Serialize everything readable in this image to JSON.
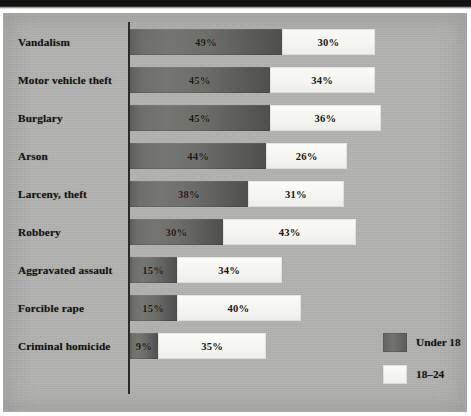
{
  "chart_data": {
    "type": "bar",
    "orientation": "horizontal",
    "stacked": true,
    "title": "",
    "subtitle": "",
    "xlabel": "",
    "ylabel": "",
    "grid": false,
    "xlim": [
      0,
      100
    ],
    "unit": "%",
    "px_per_unit": 3.1,
    "legend_position": "bottom-right",
    "categories": [
      "Vandalism",
      "Motor vehicle theft",
      "Burglary",
      "Arson",
      "Larceny, theft",
      "Robbery",
      "Aggravated assault",
      "Forcible rape",
      "Criminal homicide"
    ],
    "series": [
      {
        "name": "Under 18",
        "color": "#6b6b68",
        "values": [
          49,
          45,
          45,
          44,
          38,
          30,
          15,
          15,
          9
        ],
        "labels": [
          "49%",
          "45%",
          "45%",
          "44%",
          "38%",
          "30%",
          "15%",
          "15%",
          "9%"
        ]
      },
      {
        "name": "18–24",
        "color": "#f7f7f4",
        "values": [
          30,
          34,
          36,
          26,
          31,
          43,
          34,
          40,
          35
        ],
        "labels": [
          "30%",
          "34%",
          "36%",
          "26%",
          "31%",
          "43%",
          "34%",
          "40%",
          "35%"
        ]
      }
    ]
  },
  "rows": [
    {
      "label": "Vandalism",
      "under18": "49%",
      "to24": "30%",
      "under18_val": 49,
      "to24_val": 30
    },
    {
      "label": "Motor vehicle theft",
      "under18": "45%",
      "to24": "34%",
      "under18_val": 45,
      "to24_val": 34
    },
    {
      "label": "Burglary",
      "under18": "45%",
      "to24": "36%",
      "under18_val": 45,
      "to24_val": 36
    },
    {
      "label": "Arson",
      "under18": "44%",
      "to24": "26%",
      "under18_val": 44,
      "to24_val": 26
    },
    {
      "label": "Larceny, theft",
      "under18": "38%",
      "to24": "31%",
      "under18_val": 38,
      "to24_val": 31
    },
    {
      "label": "Robbery",
      "under18": "30%",
      "to24": "43%",
      "under18_val": 30,
      "to24_val": 43
    },
    {
      "label": "Aggravated assault",
      "under18": "15%",
      "to24": "34%",
      "under18_val": 15,
      "to24_val": 34
    },
    {
      "label": "Forcible rape",
      "under18": "15%",
      "to24": "40%",
      "under18_val": 15,
      "to24_val": 40
    },
    {
      "label": "Criminal homicide",
      "under18": "9%",
      "to24": "35%",
      "under18_val": 9,
      "to24_val": 35
    }
  ],
  "legend": {
    "items": [
      {
        "label": "Under 18",
        "color": "#6b6b68"
      },
      {
        "label": "18–24",
        "color": "#f7f7f4"
      }
    ]
  },
  "colors": {
    "panel_background": "#b2b2b0",
    "axis_line": "#2a2a28",
    "under18_bar": "#6b6b68",
    "to24_bar": "#f7f7f4",
    "text": "#16160f"
  }
}
